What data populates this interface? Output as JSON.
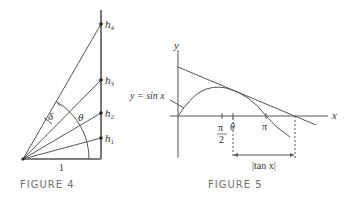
{
  "figure4": {
    "caption": "FIGURE 4",
    "labels": {
      "h1": "h",
      "h1_sub": "1",
      "h2": "h",
      "h2_sub": "2",
      "h3": "h",
      "h3_sub": "3",
      "h4": "h",
      "h4_sub": "4",
      "delta": "δ",
      "theta": "θ",
      "base": "1"
    }
  },
  "figure5": {
    "caption": "FIGURE 5",
    "labels": {
      "y_axis": "y",
      "x_axis": "x",
      "curve": "y = sin x",
      "pi_half_num": "π",
      "pi_half_den": "2",
      "theta": "θ",
      "pi": "π",
      "tan_label": "|tan x|"
    }
  },
  "colors": {
    "line": "#555555",
    "caption": "#6f6f6f"
  }
}
